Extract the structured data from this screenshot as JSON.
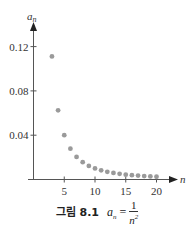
{
  "chart_data": {
    "type": "scatter",
    "xlabel": "n",
    "ylabel": "a_n",
    "x": [
      3,
      4,
      5,
      6,
      7,
      8,
      9,
      10,
      11,
      12,
      13,
      14,
      15,
      16,
      17,
      18,
      19,
      20
    ],
    "values": [
      0.1111,
      0.0625,
      0.04,
      0.0278,
      0.0204,
      0.0156,
      0.0123,
      0.01,
      0.0083,
      0.0069,
      0.0059,
      0.0051,
      0.0044,
      0.0039,
      0.0035,
      0.0031,
      0.0028,
      0.0025
    ],
    "xticks": [
      "5",
      "10",
      "15",
      "20"
    ],
    "yticks": [
      "0.04",
      "0.08",
      "0.12"
    ],
    "xlim": [
      0,
      23
    ],
    "ylim": [
      0,
      0.14
    ],
    "grid": false,
    "legend": null,
    "point_color": "#9a9a9a"
  },
  "axes": {
    "y_label": "a",
    "y_label_sub": "n",
    "x_label": "n"
  },
  "caption": {
    "prefix": "그림 8.1",
    "lhs": "a",
    "lhs_sub": "n",
    "equals": "=",
    "numerator": "1",
    "denominator": "n",
    "exponent": "2"
  }
}
